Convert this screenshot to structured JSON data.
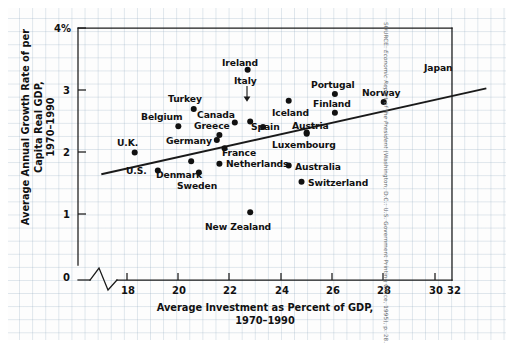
{
  "chart_data": {
    "type": "scatter",
    "title": "",
    "xlabel": "Average Investment as Percent of GDP, 1970–1990",
    "ylabel": "Average Annual Growth Rate of per Capita Real GDP, 1970–1990",
    "xlim": [
      17.0,
      32.0
    ],
    "ylim": [
      0,
      4
    ],
    "xticks": [
      18,
      20,
      22,
      24,
      26,
      28,
      30,
      32
    ],
    "xticklabels": [
      "18",
      "20",
      "22",
      "24",
      "26",
      "28",
      "30",
      "32"
    ],
    "yticks": [
      0,
      1,
      2,
      3,
      4
    ],
    "yticklabels": [
      "0",
      "1",
      "2",
      "3",
      "4%"
    ],
    "x_axis_break": true,
    "grid": true,
    "legend": null,
    "trendline": {
      "x0": 17.0,
      "y0": 1.65,
      "x1": 32.0,
      "y1": 3.03
    },
    "points": [
      {
        "name": "U.K.",
        "x": 18.3,
        "y": 2.0,
        "label_pos": "above-left"
      },
      {
        "name": "U.S.",
        "x": 19.2,
        "y": 1.71,
        "label_pos": "left"
      },
      {
        "name": "Belgium",
        "x": 20.0,
        "y": 2.42,
        "label_pos": "above-left"
      },
      {
        "name": "Turkey",
        "x": 20.6,
        "y": 2.7,
        "label_pos": "above"
      },
      {
        "name": "Denmark",
        "x": 20.5,
        "y": 1.86,
        "label_pos": "below-left"
      },
      {
        "name": "Sweden",
        "x": 20.8,
        "y": 1.68,
        "label_pos": "below"
      },
      {
        "name": "Germany",
        "x": 21.5,
        "y": 2.2,
        "label_pos": "left"
      },
      {
        "name": "Greece",
        "x": 21.6,
        "y": 2.28,
        "label_pos": "above-left"
      },
      {
        "name": "Netherlands",
        "x": 21.6,
        "y": 1.82,
        "label_pos": "right"
      },
      {
        "name": "France",
        "x": 21.8,
        "y": 2.07,
        "label_pos": "below-right"
      },
      {
        "name": "Canada",
        "x": 22.2,
        "y": 2.48,
        "label_pos": "above"
      },
      {
        "name": "Italy",
        "x": 22.8,
        "y": 2.5,
        "label_pos": "above-arrow"
      },
      {
        "name": "Ireland",
        "x": 22.7,
        "y": 3.33,
        "label_pos": "above"
      },
      {
        "name": "Spain",
        "x": 23.3,
        "y": 2.41,
        "label_pos": "right"
      },
      {
        "name": "New Zealand",
        "x": 22.8,
        "y": 1.04,
        "label_pos": "below"
      },
      {
        "name": "Australia",
        "x": 24.3,
        "y": 1.79,
        "label_pos": "right"
      },
      {
        "name": "Iceland",
        "x": 24.3,
        "y": 2.83,
        "label_pos": "below"
      },
      {
        "name": "Luxembourg",
        "x": 25.0,
        "y": 2.3,
        "label_pos": "below"
      },
      {
        "name": "Austria",
        "x": 25.0,
        "y": 2.32,
        "label_pos": "above"
      },
      {
        "name": "Switzerland",
        "x": 24.8,
        "y": 1.53,
        "label_pos": "right"
      },
      {
        "name": "Finland",
        "x": 26.1,
        "y": 2.64,
        "label_pos": "above"
      },
      {
        "name": "Portugal",
        "x": 26.1,
        "y": 2.94,
        "label_pos": "above"
      },
      {
        "name": "Norway",
        "x": 28.0,
        "y": 2.81,
        "label_pos": "above"
      },
      {
        "name": "Japan",
        "x": 31.0,
        "y": 3.07,
        "label_pos": "above"
      }
    ]
  },
  "axes": {
    "y_tick_labels": [
      "4%",
      "3",
      "2",
      "1",
      "0"
    ],
    "x_tick_labels": [
      "18",
      "20",
      "22",
      "24",
      "26",
      "28",
      "30",
      "32"
    ],
    "y_title_line1": "Average Annual Growth Rate of per Capita Real GDP,",
    "y_title_line2": "1970–1990",
    "x_title_line1": "Average Investment as Percent of GDP,",
    "x_title_line2": "1970–1990"
  },
  "source": {
    "prefix": "SOURCE:",
    "italic": "Economic Report of the President",
    "suffix": "(Washington, D.C.: U.S. Government Printing Office, 1995), p. 28."
  },
  "colors": {
    "ink": "#111111",
    "grid": "#96afc3",
    "paper": "#fdfdfd",
    "source_text": "#666a6e"
  }
}
